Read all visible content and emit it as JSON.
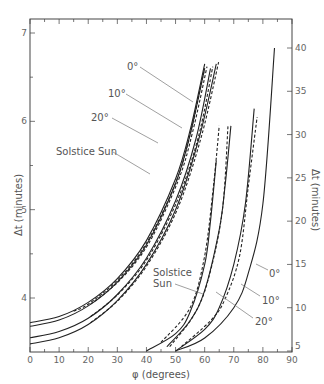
{
  "chart_data": {
    "type": "line",
    "title": "",
    "xlabel": "φ (degrees)",
    "ylabel_left": "Δt (minutes)",
    "ylabel_right": "Δt (minutes)",
    "xlim": [
      0,
      90
    ],
    "ylim_left": [
      3.6,
      7.2
    ],
    "ylim_right": [
      5,
      42
    ],
    "x_ticks": [
      "0",
      "10",
      "20",
      "30",
      "40",
      "50",
      "60",
      "70",
      "80",
      "90"
    ],
    "y_ticks_left": [
      "4",
      "5",
      "6",
      "7"
    ],
    "y_ticks_right": [
      "5",
      "10",
      "15",
      "20",
      "25",
      "30",
      "35",
      "40"
    ],
    "grid": false,
    "legend": "none (inline annotations)",
    "annotations_left_group": [
      "0°",
      "10°",
      "20°",
      "Solstice Sun"
    ],
    "annotations_right_group": [
      "Solstice Sun",
      "0°",
      "10°",
      "20°"
    ],
    "series_left_axis": [
      {
        "name": "0° (solid)",
        "x": [
          0,
          10,
          20,
          30,
          40,
          50,
          55,
          60
        ],
        "y": [
          3.72,
          3.79,
          3.95,
          4.22,
          4.65,
          5.35,
          5.9,
          6.65
        ]
      },
      {
        "name": "0° (dashed)",
        "x": [
          15,
          20,
          30,
          40,
          50,
          55,
          60
        ],
        "y": [
          3.85,
          3.93,
          4.2,
          4.62,
          5.3,
          5.85,
          6.6
        ]
      },
      {
        "name": "10° (solid)",
        "x": [
          0,
          10,
          20,
          30,
          40,
          50,
          55,
          60
        ],
        "y": [
          3.68,
          3.75,
          3.91,
          4.18,
          4.6,
          5.3,
          5.85,
          6.6
        ]
      },
      {
        "name": "20° (solid)",
        "x": [
          0,
          10,
          20,
          30,
          40,
          50,
          57,
          62
        ],
        "y": [
          3.55,
          3.62,
          3.77,
          4.04,
          4.45,
          5.1,
          5.8,
          6.6
        ]
      },
      {
        "name": "Solstice Sun (solid)",
        "x": [
          0,
          10,
          20,
          30,
          40,
          50,
          58,
          64
        ],
        "y": [
          3.48,
          3.55,
          3.7,
          3.97,
          4.38,
          5.0,
          5.8,
          6.65
        ]
      }
    ],
    "series_right_axis": [
      {
        "name": "Solstice Sun (solid)",
        "x": [
          40,
          50,
          55,
          60,
          62,
          64
        ],
        "y": [
          5,
          7,
          9.5,
          15,
          20,
          27
        ]
      },
      {
        "name": "Solstice Sun (dashed)",
        "x": [
          45,
          55,
          60,
          63,
          65
        ],
        "y": [
          6,
          10,
          16,
          24,
          31
        ]
      },
      {
        "name": "20° (solid)",
        "x": [
          47,
          55,
          60,
          65,
          67,
          69
        ],
        "y": [
          5.5,
          8.5,
          12,
          19,
          24,
          31
        ]
      },
      {
        "name": "20° (dashed)",
        "x": [
          48,
          56,
          61,
          66,
          68
        ],
        "y": [
          5.5,
          9,
          13,
          21,
          31
        ]
      },
      {
        "name": "10° (solid)",
        "x": [
          50,
          60,
          65,
          70,
          74,
          77
        ],
        "y": [
          5,
          7.5,
          10,
          15,
          22,
          33
        ]
      },
      {
        "name": "10° (dashed)",
        "x": [
          52,
          62,
          67,
          72,
          75,
          78
        ],
        "y": [
          5.5,
          8.5,
          11,
          16,
          24,
          32
        ]
      },
      {
        "name": "0° (solid)",
        "x": [
          50,
          60,
          70,
          75,
          80,
          84
        ],
        "y": [
          5,
          6.5,
          10,
          14,
          22,
          40
        ]
      }
    ]
  },
  "labels": {
    "xlabel": "φ (degrees)",
    "ylabel_left": "Δt (minutes)",
    "ylabel_right": "Δt (minutes)",
    "ann_left": {
      "a0": "0°",
      "a10": "10°",
      "a20": "20°",
      "sol": "Solstice Sun"
    },
    "ann_right": {
      "sol1": "Solstice",
      "sol2": "Sun",
      "a0": "0°",
      "a10": "10°",
      "a20": "20°"
    }
  }
}
